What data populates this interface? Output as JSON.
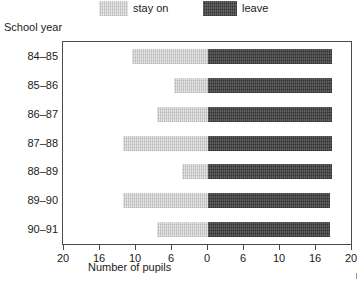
{
  "chart_data": {
    "type": "bar",
    "orientation": "horizontal",
    "style": "diverging-bidirectional",
    "title": "",
    "xlabel": "Number of pupils",
    "ylabel": "School year",
    "categories": [
      "84–85",
      "85–86",
      "86–87",
      "87–88",
      "88–89",
      "89–90",
      "90–91"
    ],
    "series": [
      {
        "name": "stay on",
        "direction": "left",
        "color": "#c9c9c9",
        "values": [
          10.5,
          4.7,
          7.0,
          11.7,
          3.6,
          11.7,
          7.0
        ]
      },
      {
        "name": "leave",
        "direction": "right",
        "color": "#474747",
        "values": [
          17.3,
          17.3,
          17.3,
          17.3,
          17.3,
          17.1,
          17.1
        ]
      }
    ],
    "xticks_left": [
      "20",
      "16",
      "10",
      "6"
    ],
    "xtick_center": "0",
    "xticks_right": [
      "6",
      "10",
      "16",
      "20"
    ],
    "xtick_labels": [
      "20",
      "16",
      "10",
      "6",
      "0",
      "6",
      "10",
      "16",
      "20"
    ],
    "xlim": [
      20,
      20
    ],
    "axis_max": 20,
    "grid": false,
    "legend_position": "top"
  },
  "legend": {
    "stay_label": "stay on",
    "leave_label": "leave"
  },
  "axes": {
    "y_title": "School year",
    "x_title": "Number of pupils"
  }
}
